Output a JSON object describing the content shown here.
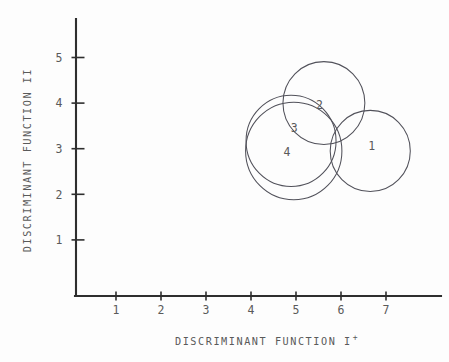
{
  "chart_data": {
    "type": "scatter",
    "title": "",
    "subtitle": "",
    "xlabel": "DISCRIMINANT FUNCTION I",
    "xlabel_superscript": "+",
    "ylabel": "DISCRIMINANT FUNCTION II",
    "xlim": [
      0,
      8.05
    ],
    "ylim": [
      0,
      5.9
    ],
    "x_ticks": [
      1,
      2,
      3,
      4,
      5,
      6,
      7
    ],
    "x_tick_labels": [
      "1",
      "2",
      "3",
      "4",
      "5",
      "6",
      "7"
    ],
    "y_ticks": [
      1,
      2,
      3,
      4,
      5
    ],
    "y_tick_labels": [
      "1",
      "2",
      "3",
      "4",
      "5"
    ],
    "grid": false,
    "legend": "none",
    "annotation_note": "Four overlapping group confidence circles labelled 1-4 in discriminant space",
    "series": [
      {
        "name": "1",
        "label": "1",
        "shape": "circle",
        "center_x": 6.65,
        "center_y": 2.95,
        "radius_x": 0.89,
        "radius_y": 0.89,
        "label_x": 6.68,
        "label_y": 3.07
      },
      {
        "name": "2",
        "label": "2",
        "shape": "circle",
        "center_x": 5.62,
        "center_y": 4.0,
        "radius_x": 0.91,
        "radius_y": 0.91,
        "label_x": 5.52,
        "label_y": 3.97
      },
      {
        "name": "3",
        "label": "3",
        "shape": "circle",
        "center_x": 4.89,
        "center_y": 3.17,
        "radius_x": 1.0,
        "radius_y": 1.0,
        "label_x": 4.96,
        "label_y": 3.45
      },
      {
        "name": "4",
        "label": "4",
        "shape": "circle",
        "center_x": 4.95,
        "center_y": 2.95,
        "radius_x": 1.07,
        "radius_y": 1.07,
        "label_x": 4.8,
        "label_y": 2.94
      }
    ]
  },
  "figure": {
    "background_color": "#fdfdfd",
    "axis_color": "#2e2e2e",
    "outline_color": "#51515a",
    "text_color": "#5a5a5a"
  }
}
